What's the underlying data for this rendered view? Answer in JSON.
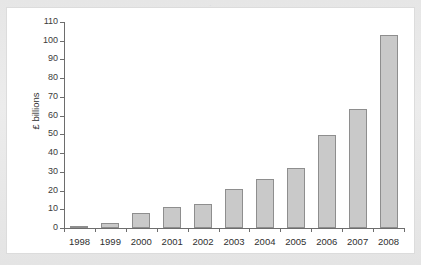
{
  "page": {
    "background_color": "#e9e9e9",
    "panel_color": "#ffffff",
    "top_text_remnant": "."
  },
  "chart_data": {
    "type": "bar",
    "title": "",
    "xlabel": "",
    "ylabel": "£ billions",
    "ylim": [
      0,
      110
    ],
    "ytick_step": 10,
    "grid": false,
    "legend": "none",
    "bar_fill_color": "#c9c9c9",
    "bar_border_color": "#8e8e8e",
    "axis_color": "#6d6d6d",
    "categories": [
      "1998",
      "1999",
      "2000",
      "2001",
      "2002",
      "2003",
      "2004",
      "2005",
      "2006",
      "2007",
      "2008"
    ],
    "values": [
      0.3,
      2.5,
      8.2,
      11.2,
      12.8,
      21,
      26,
      31.8,
      49.5,
      63.5,
      103
    ],
    "ytick_labels": [
      "0",
      "10",
      "20",
      "30",
      "40",
      "50",
      "60",
      "70",
      "80",
      "90",
      "100",
      "110"
    ]
  }
}
